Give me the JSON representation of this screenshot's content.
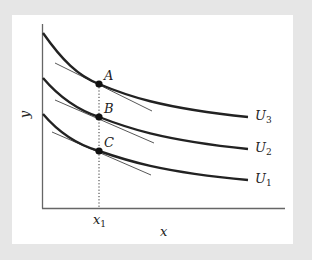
{
  "diagram": {
    "type": "indifference-curves",
    "axes": {
      "x_label": "x",
      "y_label": "y",
      "x_tick_label": "x",
      "x_tick_subscript": "1"
    },
    "curves": [
      {
        "name": "U",
        "subscript": "3",
        "label": "U3"
      },
      {
        "name": "U",
        "subscript": "2",
        "label": "U2"
      },
      {
        "name": "U",
        "subscript": "1",
        "label": "U1"
      }
    ],
    "points": [
      {
        "label": "A",
        "curve": "U3"
      },
      {
        "label": "B",
        "curve": "U2"
      },
      {
        "label": "C",
        "curve": "U1"
      }
    ],
    "colors": {
      "background": "#e6e6e6",
      "panel": "#ffffff",
      "curve": "#222222",
      "axis": "#555555",
      "tangent": "#444444"
    }
  }
}
